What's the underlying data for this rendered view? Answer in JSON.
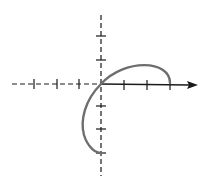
{
  "diagram": {
    "type": "parametric-curve-plot",
    "colors": {
      "axis": "#1a1a1a",
      "curve": "#6e6e6e",
      "background": "#ffffff"
    },
    "origin_px": [
      101,
      84
    ],
    "tick_spacing_px": 23,
    "x_axis": {
      "negative_ticks": 3,
      "positive_ticks": 3,
      "negative_style": "dashed",
      "positive_style": "solid",
      "arrow": "right"
    },
    "y_axis": {
      "positive_ticks": 2,
      "negative_ticks": 3,
      "style": "dashed",
      "arrow": "none"
    },
    "curve": {
      "start": [
        3,
        0
      ],
      "peak": [
        1.8,
        0.8
      ],
      "through": [
        0,
        0
      ],
      "leftmost": [
        -0.8,
        -1.8
      ],
      "end": [
        0,
        -3
      ]
    }
  }
}
